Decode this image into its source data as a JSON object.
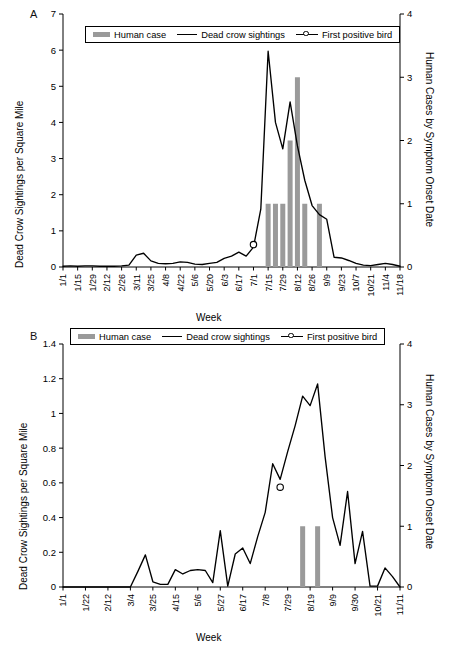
{
  "figure": {
    "panels": [
      {
        "letter": "A",
        "legend": {
          "items": [
            {
              "label": "Human case",
              "marker": "bar-swatch-icon",
              "color": "#9a9a9a"
            },
            {
              "label": "Dead crow sightings",
              "marker": "line-swatch-icon",
              "color": "#000000"
            },
            {
              "label": "First positive bird",
              "marker": "open-circle-marker-icon",
              "color": "#000000"
            }
          ]
        },
        "chart_data": {
          "type": "line",
          "title": "",
          "subtitle": "",
          "xlabel": "Week",
          "ylabel": "Dead Crow Sightings per Square Mile",
          "y2label": "Human Cases by Symptom Onset Date",
          "ylim": [
            0,
            7
          ],
          "yticks": [
            "0",
            "1",
            "2",
            "3",
            "4",
            "5",
            "6",
            "7"
          ],
          "y2lim": [
            0,
            4
          ],
          "y2ticks": [
            "0",
            "1",
            "2",
            "3",
            "4"
          ],
          "grid": false,
          "legend_position": "top-center",
          "tick_labels": [
            "1/1",
            "1/15",
            "1/29",
            "2/12",
            "2/26",
            "3/11",
            "3/25",
            "4/8",
            "4/22",
            "5/6",
            "5/20",
            "6/3",
            "6/17",
            "7/1",
            "7/15",
            "7/29",
            "8/12",
            "8/26",
            "9/9",
            "9/23",
            "10/7",
            "10/21",
            "11/4",
            "11/18"
          ],
          "x": [
            "1/1",
            "1/8",
            "1/15",
            "1/22",
            "1/29",
            "2/5",
            "2/12",
            "2/19",
            "2/26",
            "3/4",
            "3/11",
            "3/18",
            "3/25",
            "4/1",
            "4/8",
            "4/15",
            "4/22",
            "4/29",
            "5/6",
            "5/13",
            "5/20",
            "5/27",
            "6/3",
            "6/10",
            "6/17",
            "6/24",
            "7/1",
            "7/8",
            "7/15",
            "7/22",
            "7/29",
            "8/5",
            "8/12",
            "8/19",
            "8/26",
            "9/2",
            "9/9",
            "9/16",
            "9/23",
            "9/30",
            "10/7",
            "10/14",
            "10/21",
            "10/28",
            "11/4",
            "11/11",
            "11/18"
          ],
          "series": [
            {
              "name": "Dead crow sightings",
              "axis": "left",
              "values": [
                0.02,
                0.03,
                0.02,
                0.03,
                0.03,
                0.02,
                0.02,
                0.02,
                0.03,
                0.05,
                0.33,
                0.38,
                0.17,
                0.1,
                0.09,
                0.1,
                0.14,
                0.13,
                0.08,
                0.07,
                0.1,
                0.13,
                0.24,
                0.3,
                0.41,
                0.3,
                0.55,
                1.6,
                5.97,
                4.0,
                3.27,
                4.57,
                3.35,
                2.4,
                1.7,
                1.45,
                1.32,
                0.27,
                0.25,
                0.18,
                0.1,
                0.05,
                0.04,
                0.07,
                0.1,
                0.07,
                0.02
              ]
            }
          ],
          "bars": {
            "name": "Human case",
            "axis": "right",
            "color": "#9a9a9a",
            "points": [
              {
                "x": "7/15",
                "value": 1
              },
              {
                "x": "7/22",
                "value": 1
              },
              {
                "x": "7/29",
                "value": 1
              },
              {
                "x": "8/5",
                "value": 2
              },
              {
                "x": "8/12",
                "value": 3
              },
              {
                "x": "8/19",
                "value": 1
              },
              {
                "x": "9/2",
                "value": 1
              }
            ]
          },
          "annotations": [
            {
              "name": "First positive bird",
              "x": "7/1",
              "y": 0.62,
              "axis": "left",
              "marker": "open-circle"
            }
          ]
        }
      },
      {
        "letter": "B",
        "legend": {
          "items": [
            {
              "label": "Human case",
              "marker": "bar-swatch-icon",
              "color": "#9a9a9a"
            },
            {
              "label": "Dead crow sightings",
              "marker": "line-swatch-icon",
              "color": "#000000"
            },
            {
              "label": "First positive bird",
              "marker": "open-circle-marker-icon",
              "color": "#000000"
            }
          ]
        },
        "chart_data": {
          "type": "line",
          "title": "",
          "subtitle": "",
          "xlabel": "Week",
          "ylabel": "Dead Crow Sightings per Square Mile",
          "y2label": "Human Cases by Symptom Onset Date",
          "ylim": [
            0,
            1.4
          ],
          "yticks": [
            "0",
            "0.2",
            "0.4",
            "0.6",
            "0.8",
            "1",
            "1.2",
            "1.4"
          ],
          "y2lim": [
            0,
            4
          ],
          "y2ticks": [
            "0",
            "1",
            "2",
            "3",
            "4"
          ],
          "grid": false,
          "legend_position": "top-center",
          "tick_labels": [
            "1/1",
            "1/22",
            "2/12",
            "3/4",
            "3/25",
            "4/15",
            "5/6",
            "5/27",
            "6/17",
            "7/8",
            "7/29",
            "8/19",
            "9/9",
            "9/30",
            "10/21",
            "11/11"
          ],
          "x": [
            "1/1",
            "1/8",
            "1/15",
            "1/22",
            "1/29",
            "2/5",
            "2/12",
            "2/19",
            "2/26",
            "3/4",
            "3/11",
            "3/18",
            "3/25",
            "4/1",
            "4/8",
            "4/15",
            "4/22",
            "4/29",
            "5/6",
            "5/13",
            "5/20",
            "5/27",
            "6/3",
            "6/10",
            "6/17",
            "6/24",
            "7/1",
            "7/8",
            "7/15",
            "7/22",
            "7/29",
            "8/5",
            "8/12",
            "8/19",
            "8/26",
            "9/2",
            "9/9",
            "9/16",
            "9/23",
            "9/30",
            "10/7",
            "10/14",
            "10/21",
            "10/28",
            "11/4",
            "11/11"
          ],
          "series": [
            {
              "name": "Dead crow sightings",
              "axis": "left",
              "values": [
                0,
                0,
                0,
                0,
                0,
                0,
                0,
                0,
                0,
                0,
                0.09,
                0.185,
                0.03,
                0.015,
                0.015,
                0.1,
                0.075,
                0.095,
                0.1,
                0.095,
                0.025,
                0.325,
                0.005,
                0.19,
                0.225,
                0.135,
                0.29,
                0.43,
                0.71,
                0.62,
                0.78,
                0.93,
                1.1,
                1.045,
                1.17,
                0.75,
                0.4,
                0.24,
                0.55,
                0.135,
                0.32,
                0.005,
                0.005,
                0.11,
                0.06,
                0
              ]
            }
          ],
          "bars": {
            "name": "Human case",
            "axis": "right",
            "color": "#9a9a9a",
            "points": [
              {
                "x": "8/12",
                "value": 1
              },
              {
                "x": "8/26",
                "value": 1
              }
            ]
          },
          "annotations": [
            {
              "name": "First positive bird",
              "x": "7/22",
              "y": 0.575,
              "axis": "left",
              "marker": "open-circle"
            }
          ]
        }
      }
    ]
  }
}
